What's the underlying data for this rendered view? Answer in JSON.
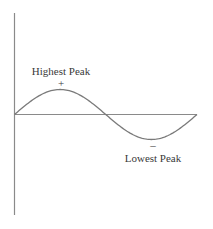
{
  "diagram": {
    "type": "sine-wave",
    "colors": {
      "background": "#ffffff",
      "axes": "#8a8a8a",
      "wave": "#7a7a7a",
      "text": "#3a3a3a"
    },
    "axes": {
      "vertical": {
        "x": 14.5,
        "y_top": 13,
        "y_bottom": 215
      },
      "horizontal": {
        "y": 114.5,
        "x_left": 14.5,
        "x_right": 197
      }
    },
    "wave": {
      "x_start": 14.5,
      "x_end": 197,
      "baseline_y": 114.5,
      "amplitude_px": 25,
      "cycles": 1
    },
    "labels": {
      "highest_peak": {
        "text": "Highest Peak",
        "x": 61,
        "y": 75
      },
      "highest_sign": {
        "text": "+",
        "x": 61,
        "y": 87
      },
      "lowest_sign": {
        "text": "–",
        "x": 153,
        "y": 149
      },
      "lowest_peak": {
        "text": "Lowest Peak",
        "x": 153,
        "y": 162
      }
    }
  }
}
